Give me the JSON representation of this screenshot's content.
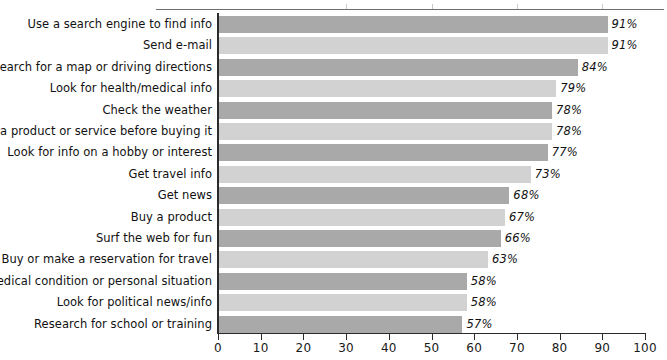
{
  "chart_data": {
    "type": "bar",
    "orientation": "horizontal",
    "title": "",
    "xlabel": "",
    "ylabel": "",
    "xlim": [
      0,
      100
    ],
    "xticks": [
      0,
      10,
      20,
      30,
      40,
      50,
      60,
      70,
      80,
      90,
      100
    ],
    "xtick_labels": [
      "0",
      "10",
      "20",
      "30",
      "40",
      "50",
      "60",
      "70",
      "80",
      "90",
      "100"
    ],
    "grid": false,
    "legend": false,
    "value_suffix": "%",
    "categories": [
      "Use a search engine to find info",
      "Send e-mail",
      "Search for a map or driving directions",
      "Look for health/medical info",
      "Check the weather",
      "Research a product or service before buying it",
      "Look for info on a hobby or interest",
      "Get travel info",
      "Get news",
      "Buy a product",
      "Surf the web for fun",
      "Buy or make a reservation for travel",
      "Support for medical condition or personal situation",
      "Look for political news/info",
      "Research for school or training"
    ],
    "values": [
      91,
      91,
      84,
      79,
      78,
      78,
      77,
      73,
      68,
      67,
      66,
      63,
      58,
      58,
      57
    ],
    "value_labels": [
      "91%",
      "91%",
      "84%",
      "79%",
      "78%",
      "78%",
      "77%",
      "73%",
      "68%",
      "67%",
      "66%",
      "63%",
      "58%",
      "58%",
      "57%"
    ],
    "bar_colors": [
      "#a9a9a9",
      "#d2d2d2",
      "#a9a9a9",
      "#d2d2d2",
      "#a9a9a9",
      "#d2d2d2",
      "#a9a9a9",
      "#d2d2d2",
      "#a9a9a9",
      "#d2d2d2",
      "#a9a9a9",
      "#d2d2d2",
      "#a9a9a9",
      "#d2d2d2",
      "#a9a9a9"
    ],
    "colors": {
      "bar_dark": "#a9a9a9",
      "bar_light": "#d2d2d2",
      "axis": "#2b2b2b",
      "text": "#111111",
      "top_rule": "#6e6e6e",
      "background": "#ffffff"
    }
  },
  "top_rule": {
    "present": true,
    "tick_positions": [
      30,
      50,
      70,
      90
    ]
  }
}
